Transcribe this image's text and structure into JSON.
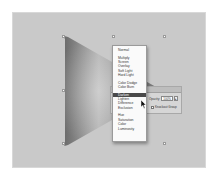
{
  "canvas": {
    "background": "#c9c9c9",
    "object": "gradient-triangle"
  },
  "blend_menu": {
    "groups": [
      [
        "Normal"
      ],
      [
        "Multiply",
        "Screen",
        "Overlay",
        "Soft Light",
        "Hard Light"
      ],
      [
        "Color Dodge",
        "Color Burn"
      ],
      [
        "Darken",
        "Lighten",
        "Difference",
        "Exclusion"
      ],
      [
        "Hue",
        "Saturation",
        "Color",
        "Luminosity"
      ]
    ],
    "items": {
      "normal": "Normal",
      "multiply": "Multiply",
      "screen": "Screen",
      "overlay": "Overlay",
      "soft_light": "Soft Light",
      "hard_light": "Hard Light",
      "color_dodge": "Color Dodge",
      "color_burn": "Color Burn",
      "darken": "Darken",
      "lighten": "Lighten",
      "difference": "Difference",
      "exclusion": "Exclusion",
      "hue": "Hue",
      "saturation": "Saturation",
      "color": "Color",
      "luminosity": "Luminosity"
    },
    "selected": "Darken"
  },
  "transparency_panel": {
    "opacity_label": "Opacity:",
    "opacity_value": "100%",
    "opacity_arrow": "▸",
    "knockout_label": "Knockout Group"
  }
}
